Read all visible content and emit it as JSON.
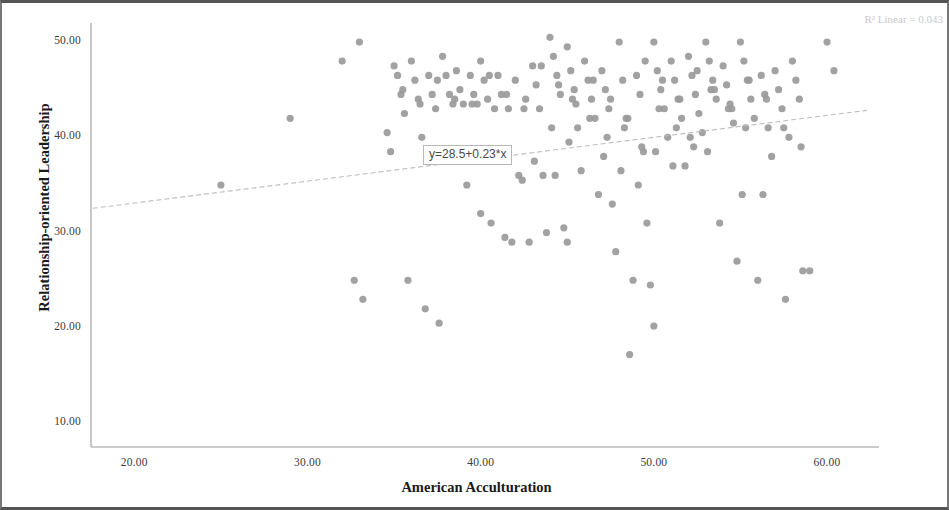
{
  "figure": {
    "r2_label": "R² Linear = 0.043",
    "equation_label": "y=28.5+0.23*x",
    "point_color": "#9a9a9a",
    "line_color": "#bdbdbd",
    "axis_color": "#9a9a9a",
    "frame_color": "#555555"
  },
  "chart_data": {
    "type": "scatter",
    "title": "",
    "subtitle": "",
    "xlabel": "American Acculturation",
    "ylabel": "Relationship-oriented Leadership",
    "xlim": [
      17.5,
      63.0
    ],
    "ylim": [
      7.5,
      52.0
    ],
    "xticks": [
      20,
      30,
      40,
      50,
      60
    ],
    "xticklabels": [
      "20.00",
      "30.00",
      "40.00",
      "50.00",
      "60.00"
    ],
    "yticks": [
      10,
      20,
      30,
      40,
      50
    ],
    "yticklabels": [
      "10.00",
      "20.00",
      "30.00",
      "40.00",
      "50.00"
    ],
    "grid": false,
    "legend": null,
    "annotations": [
      {
        "name": "r2-annotation",
        "text": "R² Linear = 0.043",
        "position": "top-right"
      },
      {
        "name": "equation-annotation",
        "text": "y=28.5+0.23*x",
        "x": 39.2,
        "y": 38.4
      }
    ],
    "fit_line": {
      "type": "linear",
      "equation": "y=28.5+0.23*x",
      "intercept": 28.5,
      "slope": 0.23,
      "r_squared": 0.043,
      "x_start": 17.6,
      "x_end": 62.3,
      "y_start": 32.55,
      "y_end": 42.83
    },
    "series": [
      {
        "name": "participants",
        "marker": "circle",
        "color": "#9a9a9a",
        "n": 178,
        "x": [
          25.0,
          29.0,
          32.0,
          32.7,
          33.0,
          33.2,
          34.6,
          34.8,
          35.0,
          35.2,
          35.4,
          35.6,
          35.8,
          36.0,
          36.2,
          36.4,
          36.6,
          36.8,
          37.0,
          37.2,
          37.4,
          37.6,
          37.8,
          38.0,
          38.2,
          38.4,
          38.6,
          38.8,
          39.0,
          39.2,
          39.4,
          39.6,
          39.8,
          40.0,
          40.0,
          40.2,
          40.4,
          40.6,
          40.8,
          41.0,
          41.2,
          41.4,
          41.6,
          41.8,
          42.0,
          42.2,
          42.4,
          42.6,
          42.8,
          43.0,
          43.2,
          43.4,
          43.6,
          43.8,
          44.0,
          44.2,
          44.4,
          44.6,
          44.8,
          45.0,
          45.0,
          45.2,
          45.4,
          45.6,
          45.8,
          46.0,
          46.2,
          46.4,
          46.6,
          46.8,
          47.0,
          47.2,
          47.4,
          47.6,
          47.8,
          48.0,
          48.2,
          48.4,
          48.6,
          48.8,
          49.0,
          49.2,
          49.4,
          49.6,
          49.8,
          50.0,
          50.0,
          50.2,
          50.4,
          50.6,
          50.8,
          51.0,
          51.2,
          51.4,
          51.6,
          51.8,
          52.0,
          52.2,
          52.4,
          52.6,
          52.8,
          53.0,
          53.2,
          53.4,
          53.6,
          53.8,
          54.0,
          54.2,
          54.4,
          54.6,
          54.8,
          55.0,
          55.2,
          55.4,
          55.6,
          55.8,
          56.0,
          56.2,
          56.4,
          56.6,
          56.8,
          57.0,
          57.2,
          57.4,
          57.6,
          57.8,
          58.0,
          58.2,
          58.4,
          58.6,
          59.0,
          60.0,
          60.4,
          35.5,
          36.5,
          37.5,
          38.5,
          39.5,
          40.5,
          41.5,
          42.5,
          43.5,
          44.5,
          45.5,
          46.5,
          47.5,
          48.5,
          49.5,
          50.5,
          51.5,
          52.5,
          53.5,
          54.5,
          55.5,
          56.5,
          57.5,
          58.5,
          44.3,
          45.3,
          46.3,
          47.3,
          48.3,
          49.3,
          50.3,
          51.3,
          52.3,
          53.3,
          54.3,
          55.3,
          56.3,
          43.1,
          44.1,
          45.1,
          47.1,
          48.1,
          49.1,
          50.1,
          51.1,
          52.1,
          53.1,
          55.1
        ],
        "y": [
          35.0,
          42.0,
          48.0,
          25.0,
          50.0,
          23.0,
          40.5,
          38.5,
          47.5,
          46.5,
          44.5,
          42.5,
          25.0,
          48.0,
          46.0,
          44.0,
          40.0,
          22.0,
          46.5,
          44.5,
          43.0,
          20.5,
          48.5,
          46.5,
          44.5,
          43.5,
          47.0,
          45.0,
          43.5,
          35.0,
          46.5,
          44.5,
          43.5,
          48.0,
          32.0,
          46.0,
          44.0,
          31.0,
          43.0,
          46.5,
          44.5,
          29.5,
          43.0,
          29.0,
          46.0,
          36.0,
          35.5,
          44.0,
          29.0,
          47.5,
          45.5,
          43.0,
          36.0,
          30.0,
          50.5,
          48.5,
          46.5,
          44.5,
          30.5,
          49.5,
          29.0,
          47.0,
          45.0,
          41.0,
          36.5,
          48.0,
          46.0,
          44.0,
          42.0,
          34.0,
          47.0,
          45.0,
          43.0,
          33.0,
          28.0,
          50.0,
          46.0,
          42.0,
          17.2,
          25.0,
          46.5,
          44.5,
          38.5,
          31.0,
          24.5,
          50.0,
          20.2,
          47.0,
          45.0,
          43.0,
          40.0,
          48.0,
          46.0,
          44.0,
          42.0,
          37.0,
          48.5,
          46.5,
          44.5,
          42.5,
          40.5,
          50.0,
          48.0,
          46.0,
          44.0,
          31.0,
          47.5,
          45.5,
          43.5,
          41.5,
          27.0,
          50.0,
          48.0,
          46.0,
          44.0,
          42.0,
          25.0,
          46.5,
          44.5,
          41.0,
          38.0,
          47.0,
          45.0,
          43.0,
          23.0,
          40.0,
          48.0,
          46.0,
          44.0,
          26.0,
          26.0,
          50.0,
          47.0,
          45.0,
          43.5,
          46.0,
          44.0,
          43.5,
          46.5,
          44.5,
          43.0,
          47.5,
          45.5,
          43.5,
          46.0,
          44.0,
          42.0,
          48.0,
          46.0,
          44.0,
          47.0,
          45.0,
          43.0,
          46.0,
          44.0,
          41.0,
          39.0,
          36.0,
          44.0,
          42.0,
          40.0,
          41.0,
          39.0,
          43.0,
          41.0,
          39.0,
          45.0,
          43.0,
          41.0,
          34.0,
          37.5,
          41.0,
          39.5,
          38.0,
          36.5,
          35.0,
          38.5,
          37.0,
          40.0,
          38.5,
          34.0
        ]
      }
    ]
  }
}
